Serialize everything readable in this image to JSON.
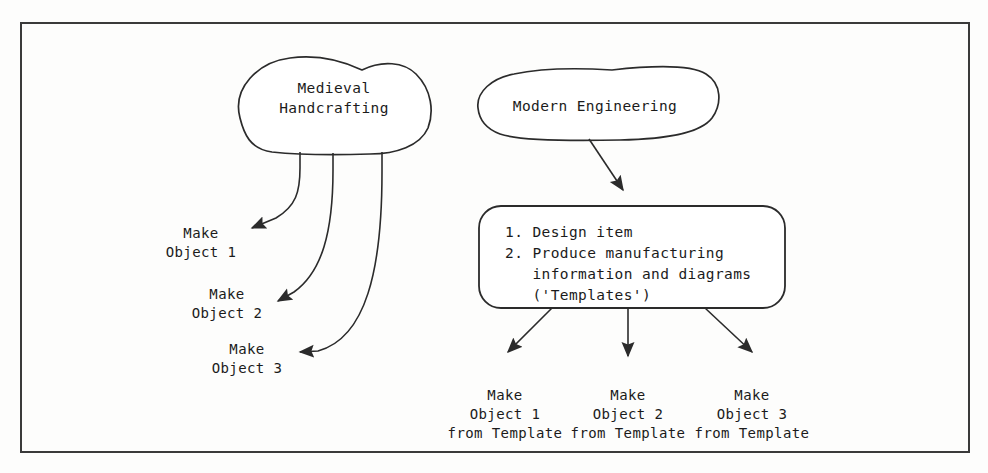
{
  "figure": {
    "title_shapes": {
      "medieval_cloud": "Medieval\nHandcrafting",
      "modern_cloud": "Modern Engineering"
    },
    "process_box": {
      "line1": "1. Design item",
      "line2": "2. Produce manufacturing",
      "line3": "   information and diagrams",
      "line4": "   ('Templates')"
    },
    "medieval_outputs": [
      {
        "line1": "Make",
        "line2": "Object 1"
      },
      {
        "line1": "Make",
        "line2": "Object 2"
      },
      {
        "line1": "Make",
        "line2": "Object 3"
      }
    ],
    "modern_outputs": [
      {
        "line1": "Make",
        "line2": "Object 1",
        "line3": "from Template"
      },
      {
        "line1": "Make",
        "line2": "Object 2",
        "line3": "from Template"
      },
      {
        "line1": "Make",
        "line2": "Object 3",
        "line3": "from Template"
      }
    ],
    "colors": {
      "stroke": "#262626",
      "fill": "#ffffff",
      "text": "#1b1b1b",
      "frame": "#333333",
      "background": "#fdfdfc"
    }
  }
}
